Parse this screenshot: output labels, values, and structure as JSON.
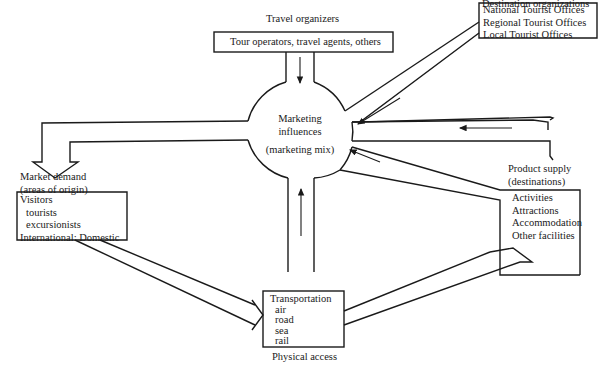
{
  "diagram": {
    "type": "tourism-system-flow",
    "center": {
      "line1": "Marketing",
      "line2": "influences",
      "line3": "(marketing mix)"
    },
    "travel_organizers": {
      "heading": "Travel organizers",
      "box": "Tour operators, travel agents, others"
    },
    "destination_organizations": {
      "heading": "Destination organizations",
      "items": [
        "National Tourist Offices",
        "Regional Tourist Offices",
        "Local Tourist Offices"
      ]
    },
    "market_demand": {
      "heading1": "Market demand",
      "heading2": "(areas of origin)",
      "items": [
        "Visitors",
        "tourists",
        "excursionists",
        "International:  Domestic"
      ]
    },
    "product_supply": {
      "heading1": "Product supply",
      "heading2": "(destinations)",
      "items": [
        "Activities",
        "Attractions",
        "Accommodation",
        "Other facilities"
      ]
    },
    "physical_access": {
      "heading": "Physical access",
      "items": [
        "Transportation",
        "air",
        "road",
        "sea",
        "rail"
      ]
    },
    "stroke_color": "#1a1a1a",
    "background": "#ffffff"
  }
}
